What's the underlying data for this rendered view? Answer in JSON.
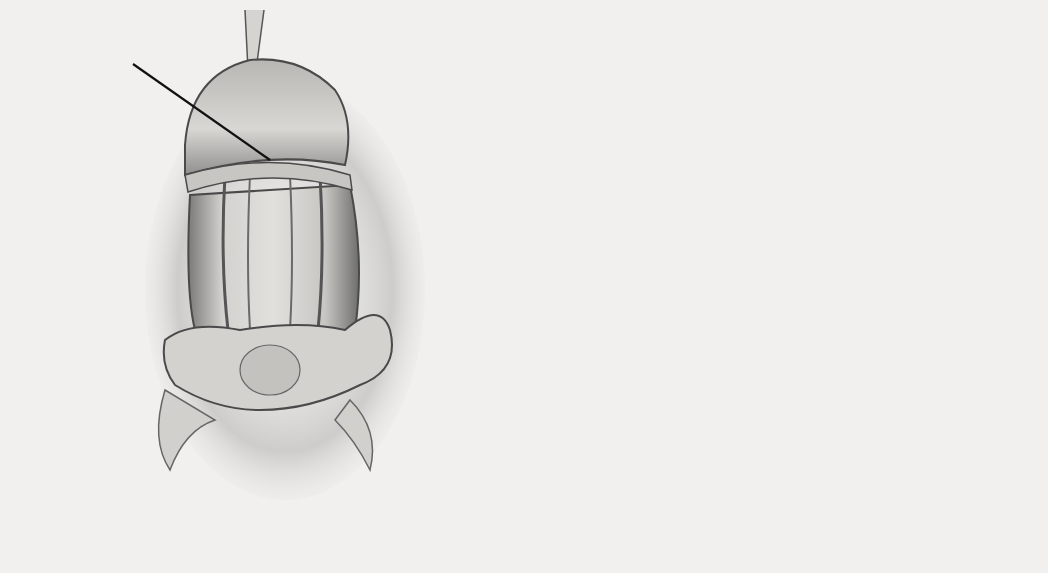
{
  "figure": {
    "panels": [
      {
        "id": "J",
        "letter": "J",
        "labels": {
          "urethra": "Urethra",
          "nvb": "NVB",
          "ventrally_displaced_urethra": "Ventrally\ndisplaced\nurethra",
          "corporal_bodies": "Corporal\nbodies",
          "mesentery": "Mesentery"
        }
      },
      {
        "id": "K",
        "letter": "K",
        "signature": "L. Sillerotoni"
      },
      {
        "id": "L",
        "letter": "L",
        "labels": {
          "corporal_bodies": "Corporal bodies",
          "urethra": "Urethra"
        }
      }
    ],
    "colors": {
      "background": "#f1f0ee",
      "shading_dark": "#5a5a5a",
      "shading_mid": "#9a9a9a",
      "tissue_light": "#d8d6d2",
      "leader_line": "#111111"
    }
  }
}
